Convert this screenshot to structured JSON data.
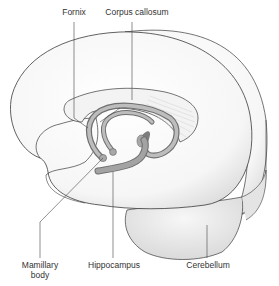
{
  "diagram": {
    "type": "anatomical-illustration",
    "colors": {
      "outline": "#3a3a3a",
      "brain_fill": "#f7f7f7",
      "shade": "#d9d9d9",
      "fornix_fill": "#b5b5b5",
      "fornix_dark": "#7d7d7d",
      "callosum_fill": "#f2f2f2",
      "cerebellum_fill": "#e9e9e9",
      "leader_line": "#444444",
      "label_text": "#333333"
    },
    "labels": {
      "fornix": "Fornix",
      "corpus_callosum": "Corpus callosum",
      "mamillary_body_line1": "Mamillary",
      "mamillary_body_line2": "body",
      "hippocampus": "Hippocampus",
      "cerebellum": "Cerebellum"
    }
  }
}
